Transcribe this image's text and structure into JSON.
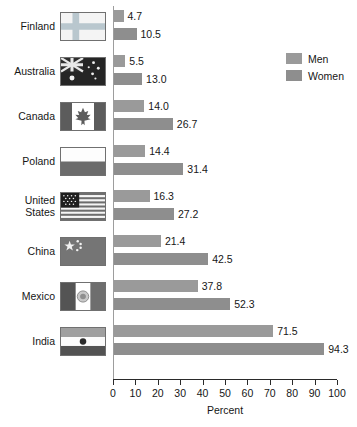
{
  "chart_data": {
    "type": "bar",
    "orientation": "horizontal",
    "title": "",
    "xlabel": "Percent",
    "ylabel": "",
    "xlim": [
      0,
      100
    ],
    "xticks": [
      0,
      10,
      20,
      30,
      40,
      50,
      60,
      70,
      80,
      90,
      100
    ],
    "xtick_labels": [
      "0",
      "10",
      "20",
      "30",
      "40",
      "50",
      "60",
      "70",
      "80",
      "90",
      "100"
    ],
    "grid": false,
    "legend_position": "top-right",
    "legend": [
      "Men",
      "Women"
    ],
    "categories": [
      "Finland",
      "Australia",
      "Canada",
      "Poland",
      "United States",
      "China",
      "Mexico",
      "India"
    ],
    "series": [
      {
        "name": "Men",
        "color": "#9a9a9a",
        "values": [
          4.7,
          5.5,
          14.0,
          14.4,
          16.3,
          21.4,
          37.8,
          71.5
        ]
      },
      {
        "name": "Women",
        "color": "#8e8e8e",
        "values": [
          10.5,
          13.0,
          26.7,
          31.4,
          27.2,
          42.5,
          52.3,
          94.3
        ]
      }
    ],
    "value_labels": {
      "Men": [
        "4.7",
        "5.5",
        "14.0",
        "14.4",
        "16.3",
        "21.4",
        "37.8",
        "71.5"
      ],
      "Women": [
        "10.5",
        "13.0",
        "26.7",
        "31.4",
        "27.2",
        "42.5",
        "52.3",
        "94.3"
      ]
    }
  },
  "rows": [
    {
      "label": "Finland",
      "label_lines": [
        "Finland"
      ],
      "flag": "flag-finland",
      "men": 4.7,
      "women": 10.5,
      "men_label": "4.7",
      "women_label": "10.5"
    },
    {
      "label": "Australia",
      "label_lines": [
        "Australia"
      ],
      "flag": "flag-australia",
      "men": 5.5,
      "women": 13.0,
      "men_label": "5.5",
      "women_label": "13.0"
    },
    {
      "label": "Canada",
      "label_lines": [
        "Canada"
      ],
      "flag": "flag-canada",
      "men": 14.0,
      "women": 26.7,
      "men_label": "14.0",
      "women_label": "26.7"
    },
    {
      "label": "Poland",
      "label_lines": [
        "Poland"
      ],
      "flag": "flag-poland",
      "men": 14.4,
      "women": 31.4,
      "men_label": "14.4",
      "women_label": "31.4"
    },
    {
      "label": "United States",
      "label_lines": [
        "United",
        "States"
      ],
      "flag": "flag-usa",
      "men": 16.3,
      "women": 27.2,
      "men_label": "16.3",
      "women_label": "27.2"
    },
    {
      "label": "China",
      "label_lines": [
        "China"
      ],
      "flag": "flag-china",
      "men": 21.4,
      "women": 42.5,
      "men_label": "21.4",
      "women_label": "42.5"
    },
    {
      "label": "Mexico",
      "label_lines": [
        "Mexico"
      ],
      "flag": "flag-mexico",
      "men": 37.8,
      "women": 52.3,
      "men_label": "37.8",
      "women_label": "52.3"
    },
    {
      "label": "India",
      "label_lines": [
        "India"
      ],
      "flag": "flag-india",
      "men": 71.5,
      "women": 94.3,
      "men_label": "71.5",
      "women_label": "94.3"
    }
  ],
  "axis": {
    "title": "Percent",
    "ticks": [
      "0",
      "10",
      "20",
      "30",
      "40",
      "50",
      "60",
      "70",
      "80",
      "90",
      "100"
    ]
  },
  "legend": {
    "items": [
      {
        "label": "Men",
        "color": "#9a9a9a"
      },
      {
        "label": "Women",
        "color": "#8e8e8e"
      }
    ]
  },
  "colors": {
    "men_bar": "#9a9a9a",
    "women_bar": "#8e8e8e",
    "axis": "#2a2a2a",
    "text": "#161616",
    "background": "#ffffff"
  }
}
